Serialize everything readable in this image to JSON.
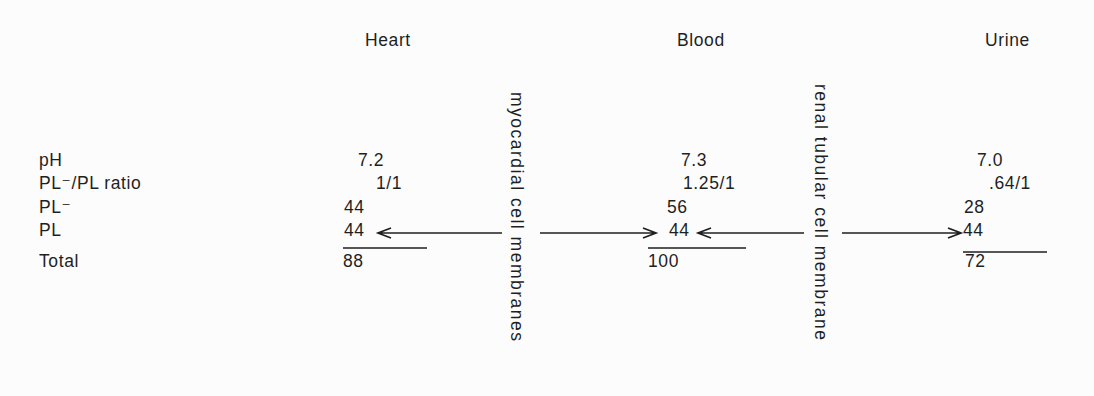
{
  "figure": {
    "colors": {
      "ink": "#1f1f1f",
      "background": "#fcfcfc"
    },
    "row_labels": {
      "ph": "pH",
      "ratio": "PL⁻/PL ratio",
      "pl_ionized": "PL⁻",
      "pl": "PL",
      "total": "Total"
    },
    "columns": [
      {
        "header": "Heart",
        "values": {
          "ph": "7.2",
          "ratio": "1/1",
          "pl_ionized": "44",
          "pl": "44",
          "total": "88"
        }
      },
      {
        "header": "Blood",
        "values": {
          "ph": "7.3",
          "ratio": "1.25/1",
          "pl_ionized": "56",
          "pl": "44",
          "total": "100"
        }
      },
      {
        "header": "Urine",
        "values": {
          "ph": "7.0",
          "ratio": ".64/1",
          "pl_ionized": "28",
          "pl": "44",
          "total": "72"
        }
      }
    ],
    "membranes": [
      {
        "label": "myocardial cell membranes"
      },
      {
        "label": "renal tubular cell membrane"
      }
    ]
  }
}
